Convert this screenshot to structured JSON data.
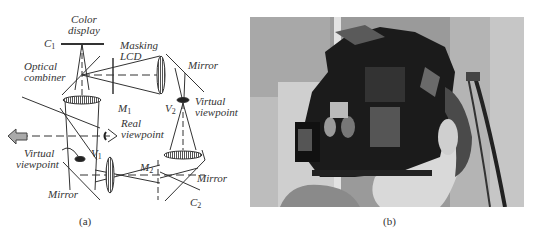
{
  "figure": {
    "panel_a": {
      "caption": "(a)",
      "labels": {
        "color_display": [
          "Color",
          "display"
        ],
        "c1": "C",
        "c1_sub": "1",
        "masking_lcd": [
          "Masking",
          "LCD"
        ],
        "optical_combiner": [
          "Optical",
          "combiner"
        ],
        "mirror_top": "Mirror",
        "m1": "M",
        "m1_sub": "1",
        "v2": "V",
        "v2_sub": "2",
        "virtual_viewpoint_right": [
          "Virtual",
          "viewpoint"
        ],
        "real_viewpoint": [
          "Real",
          "viewpoint"
        ],
        "virtual_viewpoint_left": [
          "Virtual",
          "viewpoint"
        ],
        "v1": "V",
        "v1_sub": "1",
        "m2": "M",
        "m2_sub": "2",
        "mirror_left": "Mirror",
        "mirror_right": "Mirror",
        "c2": "C",
        "c2_sub": "2"
      }
    },
    "panel_b": {
      "caption": "(b)",
      "description": "Photo of person wearing head-mounted display prototype"
    }
  }
}
